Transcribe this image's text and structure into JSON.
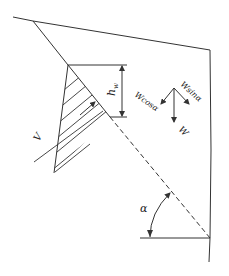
{
  "diagram": {
    "type": "slope-stability-sketch",
    "labels": {
      "water_height": "h",
      "water_height_sub": "w",
      "force_weight": "W",
      "force_normal": "Wcosα",
      "force_tangent": "Wsinα",
      "seepage": "V",
      "angle": "α"
    },
    "colors": {
      "stroke": "#333333",
      "background": "#ffffff"
    }
  }
}
